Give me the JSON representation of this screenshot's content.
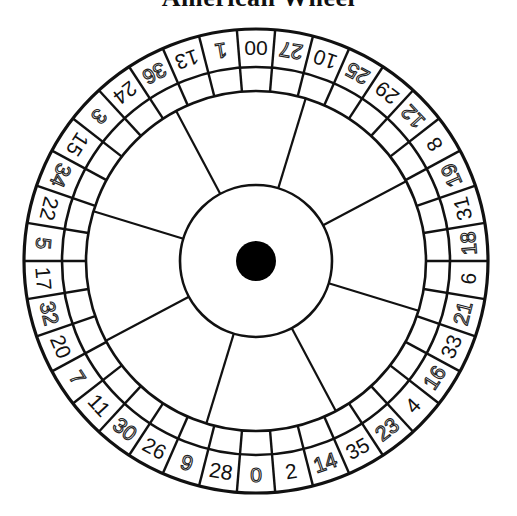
{
  "title": "American Wheel",
  "wheel": {
    "type": "american-roulette",
    "pocket_count": 38,
    "pockets_clockwise_from_top": [
      {
        "number": "00",
        "style": "solid"
      },
      {
        "number": "27",
        "style": "outline"
      },
      {
        "number": "10",
        "style": "solid"
      },
      {
        "number": "25",
        "style": "outline"
      },
      {
        "number": "29",
        "style": "solid"
      },
      {
        "number": "12",
        "style": "outline"
      },
      {
        "number": "8",
        "style": "solid"
      },
      {
        "number": "19",
        "style": "outline"
      },
      {
        "number": "31",
        "style": "solid"
      },
      {
        "number": "18",
        "style": "outline"
      },
      {
        "number": "6",
        "style": "solid"
      },
      {
        "number": "21",
        "style": "outline"
      },
      {
        "number": "33",
        "style": "solid"
      },
      {
        "number": "16",
        "style": "outline"
      },
      {
        "number": "4",
        "style": "solid"
      },
      {
        "number": "23",
        "style": "outline"
      },
      {
        "number": "35",
        "style": "solid"
      },
      {
        "number": "14",
        "style": "outline"
      },
      {
        "number": "2",
        "style": "solid"
      },
      {
        "number": "0",
        "style": "outline"
      },
      {
        "number": "28",
        "style": "solid"
      },
      {
        "number": "9",
        "style": "outline"
      },
      {
        "number": "26",
        "style": "solid"
      },
      {
        "number": "30",
        "style": "outline"
      },
      {
        "number": "11",
        "style": "solid"
      },
      {
        "number": "7",
        "style": "outline"
      },
      {
        "number": "20",
        "style": "solid"
      },
      {
        "number": "32",
        "style": "outline"
      },
      {
        "number": "17",
        "style": "solid"
      },
      {
        "number": "5",
        "style": "outline"
      },
      {
        "number": "22",
        "style": "solid"
      },
      {
        "number": "34",
        "style": "outline"
      },
      {
        "number": "15",
        "style": "solid"
      },
      {
        "number": "3",
        "style": "outline"
      },
      {
        "number": "24",
        "style": "solid"
      },
      {
        "number": "36",
        "style": "outline"
      },
      {
        "number": "13",
        "style": "solid"
      },
      {
        "number": "1",
        "style": "outline"
      }
    ],
    "spoke_count": 8,
    "colors": {
      "line": "#111111",
      "background": "#ffffff",
      "hub_dot": "#000000"
    }
  }
}
